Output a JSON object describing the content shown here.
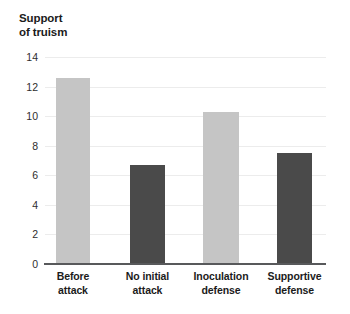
{
  "chart_data": {
    "type": "bar",
    "title": "Support\nof truism",
    "title_lines": [
      "Support",
      "of truism"
    ],
    "xlabel": "",
    "ylabel": "Support of truism",
    "categories": [
      "Before attack",
      "No initial attack",
      "Inoculation defense",
      "Supportive defense"
    ],
    "category_lines": [
      [
        "Before",
        "attack"
      ],
      [
        "No initial",
        "attack"
      ],
      [
        "Inoculation",
        "defense"
      ],
      [
        "Supportive",
        "defense"
      ]
    ],
    "values": [
      12.6,
      6.7,
      10.3,
      7.5
    ],
    "ylim": [
      0,
      14
    ],
    "yticks": [
      0,
      2,
      4,
      6,
      8,
      10,
      12,
      14
    ],
    "ytick_labels": [
      "0",
      "2",
      "4",
      "6",
      "8",
      "10",
      "12",
      "14"
    ],
    "grid": true,
    "legend": "none",
    "bar_colors": [
      "#c5c5c5",
      "#4a4a4a",
      "#c5c5c5",
      "#4a4a4a"
    ],
    "colors": {
      "light_bar": "#c5c5c5",
      "dark_bar": "#4a4a4a",
      "gridline": "#ececec",
      "axis": "#58595b",
      "text": "#1b1b1b",
      "background": "#ffffff"
    }
  }
}
